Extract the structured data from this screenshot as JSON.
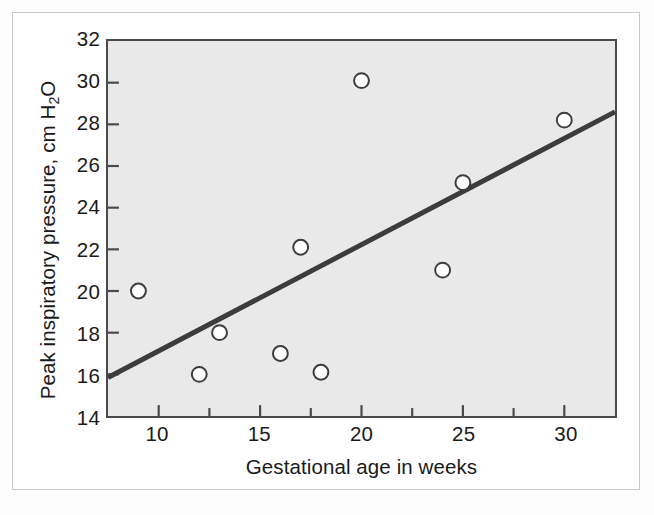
{
  "figure": {
    "background_color": "#ffffff",
    "frame_color": "#c9c9cc",
    "plot_background_color": "#e9e9e9",
    "axis_color": "#4a4a4a"
  },
  "chart_data": {
    "type": "scatter",
    "title": "",
    "xlabel": "Gestational age in weeks",
    "ylabel": "Peak inspiratory pressure, cm H",
    "ylabel_sub": "2",
    "ylabel_tail": "O",
    "ylabel_full": "Peak inspiratory pressure, cm H2O",
    "xlim": [
      7.5,
      32.5
    ],
    "ylim": [
      14,
      32
    ],
    "xticks": [
      10,
      15,
      20,
      25,
      30
    ],
    "xtick_labels": [
      "10",
      "15",
      "20",
      "25",
      "30"
    ],
    "x_minor_ticks": [
      12.5,
      17.5,
      22.5,
      27.5
    ],
    "yticks": [
      14,
      16,
      18,
      20,
      22,
      24,
      26,
      28,
      30,
      32
    ],
    "ytick_labels": [
      "14",
      "16",
      "18",
      "20",
      "22",
      "24",
      "26",
      "28",
      "30",
      "32"
    ],
    "grid": false,
    "legend": false,
    "marker": {
      "shape": "open-circle",
      "radius": 7.5,
      "fill": "#ffffff",
      "edge_color": "#3c3c3c",
      "edge_width": 2
    },
    "points": [
      {
        "x": 9,
        "y": 20.0
      },
      {
        "x": 12,
        "y": 16.0
      },
      {
        "x": 13,
        "y": 18.0
      },
      {
        "x": 16,
        "y": 17.0
      },
      {
        "x": 17,
        "y": 22.1
      },
      {
        "x": 18,
        "y": 16.1
      },
      {
        "x": 20,
        "y": 30.1
      },
      {
        "x": 24,
        "y": 21.0
      },
      {
        "x": 25,
        "y": 25.2
      },
      {
        "x": 30,
        "y": 28.2
      }
    ],
    "series": [
      {
        "name": "observations",
        "x": [
          9,
          12,
          13,
          16,
          17,
          18,
          20,
          24,
          25,
          30
        ],
        "values": [
          20.0,
          16.0,
          18.0,
          17.0,
          22.1,
          16.1,
          30.1,
          21.0,
          25.2,
          28.2
        ]
      }
    ],
    "regression_line": {
      "name": "least-squares fit",
      "color": "#3c3c3c",
      "width": 5,
      "x_start": 7.5,
      "y_start": 15.85,
      "x_end": 32.5,
      "y_end": 28.6,
      "slope": 0.51,
      "intercept": 12.02
    }
  }
}
